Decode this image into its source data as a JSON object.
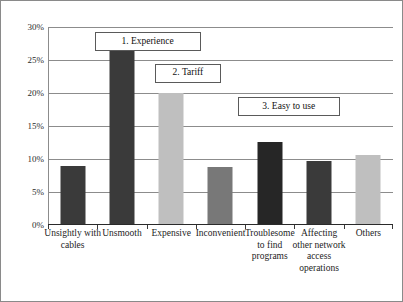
{
  "chart_data": {
    "type": "bar",
    "title": "",
    "xlabel": "",
    "ylabel": "",
    "ylim": [
      0,
      30
    ],
    "ytick_labels": [
      "0%",
      "5%",
      "10%",
      "15%",
      "20%",
      "25%",
      "30%"
    ],
    "ytick_values": [
      0,
      5,
      10,
      15,
      20,
      25,
      30
    ],
    "grid": true,
    "legend": "none",
    "categories": [
      "Unsightly with cables",
      "Unsmooth",
      "Expensive",
      "Inconvenient",
      "Troublesome to find programs",
      "Affecting other network access operations",
      "Others"
    ],
    "values": [
      8.8,
      27.5,
      19.8,
      8.6,
      12.5,
      9.6,
      10.5
    ],
    "bar_colors": [
      "#3a3a3a",
      "#3a3a3a",
      "#bfbfbf",
      "#787878",
      "#262626",
      "#3a3a3a",
      "#bfbfbf"
    ],
    "annotations": [
      {
        "text": "1. Experience",
        "x_pct": 13.5,
        "y_pct": 2.5,
        "w": 106,
        "h": 19
      },
      {
        "text": "2. Tariff",
        "x_pct": 31.0,
        "y_pct": 18.5,
        "w": 66,
        "h": 19
      },
      {
        "text": "3. Easy to use",
        "x_pct": 55.0,
        "y_pct": 35.5,
        "w": 102,
        "h": 19
      }
    ]
  }
}
